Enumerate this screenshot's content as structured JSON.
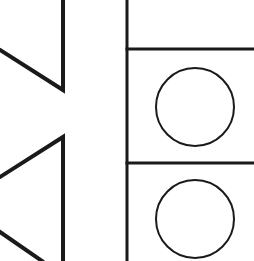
{
  "canvas": {
    "width": 254,
    "height": 261,
    "background": "#ffffff",
    "stroke_color": "#1a1a1a"
  },
  "left_shapes": {
    "upper_chevron": {
      "points": [
        [
          0,
          50
        ],
        [
          63,
          90
        ],
        [
          63,
          0
        ]
      ],
      "stroke_width": 4
    },
    "lower_chevron": {
      "points": [
        [
          0,
          177
        ],
        [
          63,
          137
        ],
        [
          63,
          261
        ]
      ],
      "stroke_width": 4
    },
    "bottom_diagonal": {
      "points": [
        [
          0,
          232
        ],
        [
          42,
          261
        ]
      ],
      "stroke_width": 4
    }
  },
  "right_panel": {
    "divider_vertical": {
      "x": 127,
      "y1": 0,
      "y2": 261,
      "stroke_width": 3
    },
    "divider_horizontal_1": {
      "y": 49,
      "x1": 127,
      "x2": 254,
      "stroke_width": 3
    },
    "divider_horizontal_2": {
      "y": 163,
      "x1": 127,
      "x2": 254,
      "stroke_width": 3
    },
    "circles": [
      {
        "cx": 195,
        "cy": 107,
        "r": 39,
        "stroke_width": 2
      },
      {
        "cx": 195,
        "cy": 219,
        "r": 39,
        "stroke_width": 2
      }
    ]
  }
}
